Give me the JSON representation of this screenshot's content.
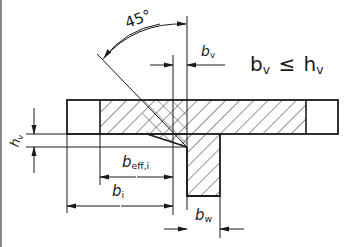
{
  "diagram": {
    "type": "technical-drawing",
    "angle_label": "45°",
    "condition": {
      "lhs_base": "b",
      "lhs_sub": "v",
      "operator": "≤",
      "rhs_base": "h",
      "rhs_sub": "v"
    },
    "dimensions": {
      "bv": {
        "base": "b",
        "sub": "v"
      },
      "hv": {
        "base": "h",
        "sub": "v"
      },
      "beff": {
        "base": "b",
        "sub": "eff,i"
      },
      "bi": {
        "base": "b",
        "sub": "i"
      },
      "bw": {
        "base": "b",
        "sub": "w"
      }
    },
    "colors": {
      "line": "#1a1a1a",
      "hatch": "#2a2a2a",
      "frame": "#8a8a8a",
      "background": "#ffffff"
    }
  }
}
